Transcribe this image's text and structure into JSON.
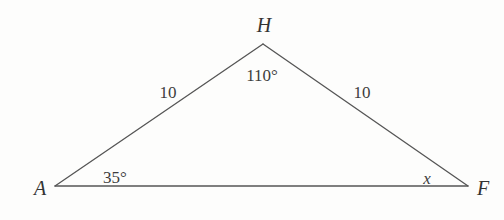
{
  "figure": {
    "kind": "triangle-diagram",
    "name": "triangle-AHF",
    "width": 504,
    "height": 220,
    "background_color": "#fdfdfc",
    "stroke_color": "#555555",
    "stroke_width": 1.3,
    "text_color": "#3a3a3a"
  },
  "vertices": [
    {
      "id": "A",
      "label": "A",
      "point_x": 55,
      "point_y": 186,
      "label_x": 40,
      "label_y": 188
    },
    {
      "id": "H",
      "label": "H",
      "point_x": 263,
      "point_y": 44,
      "label_x": 264,
      "label_y": 25
    },
    {
      "id": "F",
      "label": "F",
      "point_x": 468,
      "point_y": 186,
      "label_x": 483,
      "label_y": 188
    }
  ],
  "edges": [
    {
      "id": "AH",
      "from": "A",
      "to": "H"
    },
    {
      "id": "HF",
      "from": "H",
      "to": "F"
    },
    {
      "id": "AF",
      "from": "A",
      "to": "F"
    }
  ],
  "side_labels": [
    {
      "id": "side-AH",
      "text": "10",
      "x": 168,
      "y": 92
    },
    {
      "id": "side-HF",
      "text": "10",
      "x": 362,
      "y": 92
    }
  ],
  "angle_labels": [
    {
      "id": "angle-H",
      "text": "110°",
      "x": 262,
      "y": 75,
      "style": "measure"
    },
    {
      "id": "angle-A",
      "text": "35°",
      "x": 115,
      "y": 177,
      "style": "measure"
    },
    {
      "id": "angle-F",
      "text": "x",
      "x": 427,
      "y": 178,
      "style": "variable"
    }
  ]
}
